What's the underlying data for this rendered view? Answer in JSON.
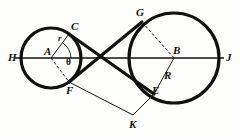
{
  "figure": {
    "type": "geometric-diagram",
    "canvas": {
      "width": 239,
      "height": 138
    },
    "style": {
      "background": "#fdfdfb",
      "ink": "#111111",
      "thick_stroke": 3.0,
      "medium_stroke": 1.6,
      "thin_stroke": 0.9,
      "dash_pattern": "3,2"
    },
    "circles": [
      {
        "name": "small-circle",
        "center_label": "A",
        "cx": 51,
        "cy": 58,
        "r": 30,
        "radius_label": "r"
      },
      {
        "name": "large-circle",
        "center_label": "B",
        "cx": 174,
        "cy": 58,
        "r": 45,
        "radius_label": "R"
      }
    ],
    "axis_line": {
      "name": "line-HJ",
      "from": "H",
      "to": "J",
      "x1": 15,
      "y1": 58,
      "x2": 224,
      "y2": 58
    },
    "points": [
      {
        "id": "H",
        "label": "H",
        "x": 21,
        "y": 58,
        "label_x": 8,
        "label_y": 52
      },
      {
        "id": "A",
        "label": "A",
        "x": 51,
        "y": 58,
        "label_x": 44,
        "label_y": 47
      },
      {
        "id": "C",
        "label": "C",
        "x": 69,
        "y": 34,
        "label_x": 71,
        "label_y": 22
      },
      {
        "id": "F",
        "label": "F",
        "x": 69,
        "y": 82,
        "label_x": 66,
        "label_y": 85
      },
      {
        "id": "X",
        "label": "",
        "x": 101,
        "y": 58,
        "label_x": 0,
        "label_y": 0
      },
      {
        "id": "G",
        "label": "G",
        "x": 142,
        "y": 22,
        "label_x": 136,
        "label_y": 8
      },
      {
        "id": "B",
        "label": "B",
        "x": 174,
        "y": 58,
        "label_x": 173,
        "label_y": 46
      },
      {
        "id": "E",
        "label": "E",
        "x": 154,
        "y": 94,
        "label_x": 152,
        "label_y": 86
      },
      {
        "id": "J",
        "label": "J",
        "x": 219,
        "y": 58,
        "label_x": 226,
        "label_y": 52
      },
      {
        "id": "K",
        "label": "K",
        "x": 133,
        "y": 115,
        "label_x": 129,
        "label_y": 119
      }
    ],
    "segment_labels": [
      {
        "id": "r-label",
        "label": "r",
        "x": 58,
        "y": 36
      },
      {
        "id": "R-label",
        "label": "R",
        "x": 164,
        "y": 73
      },
      {
        "id": "theta-label",
        "label": "θ",
        "x": 66,
        "y": 62
      }
    ],
    "tangent_lines": [
      {
        "name": "tangent-C-to-E",
        "from": "C",
        "to": "E",
        "weight": "thick"
      },
      {
        "name": "tangent-F-to-G",
        "from": "F",
        "to": "G",
        "weight": "thick"
      }
    ],
    "construction_lines": [
      {
        "name": "radius-A-to-C",
        "from": "A",
        "to": "C",
        "style": "solid"
      },
      {
        "name": "radius-A-to-F",
        "from": "A",
        "to": "F",
        "style": "dashed"
      },
      {
        "name": "radius-B-to-G",
        "from": "B",
        "to": "G",
        "style": "dashed"
      },
      {
        "name": "radius-B-to-E",
        "from": "B",
        "to": "E",
        "style": "solid"
      },
      {
        "name": "segment-F-to-K",
        "from": "F",
        "to": "K",
        "style": "solid"
      },
      {
        "name": "segment-K-to-E",
        "from": "K",
        "to": "E",
        "style": "solid"
      },
      {
        "name": "segment-B-to-K",
        "from": "B",
        "to": "K",
        "style": "solid"
      }
    ],
    "angle_arc": {
      "name": "angle-theta-at-A",
      "vertex": "A",
      "label": "θ"
    }
  }
}
